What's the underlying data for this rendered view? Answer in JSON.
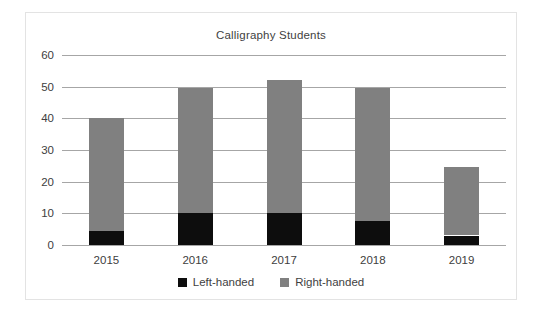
{
  "chart_data": {
    "type": "bar",
    "subtype": "stacked-column",
    "title": "Calligraphy Students",
    "xlabel": "",
    "ylabel": "",
    "categories": [
      "2015",
      "2016",
      "2017",
      "2018",
      "2019"
    ],
    "series": [
      {
        "name": "Left-handed",
        "color": "#0d0d0d",
        "values": [
          4.5,
          10,
          10,
          7.5,
          3
        ]
      },
      {
        "name": "Right-handed",
        "color": "#808080",
        "values": [
          35.5,
          39.5,
          42,
          42,
          21.5
        ]
      }
    ],
    "totals": [
      40,
      49.5,
      52,
      49.5,
      24.5
    ],
    "ylim": [
      0,
      60
    ],
    "ytick_step": 10,
    "yticks": [
      "60",
      "50",
      "40",
      "30",
      "20",
      "10",
      "0"
    ],
    "ytick_values": [
      60,
      50,
      40,
      30,
      20,
      10,
      0
    ],
    "grid": true,
    "legend_position": "bottom",
    "legend": [
      {
        "label": "Left-handed",
        "swatch": "#0d0d0d"
      },
      {
        "label": "Right-handed",
        "swatch": "#808080"
      }
    ],
    "frame_border_color": "#e3e3e3",
    "gridline_color": "#a6a6a6",
    "background": "#ffffff"
  }
}
